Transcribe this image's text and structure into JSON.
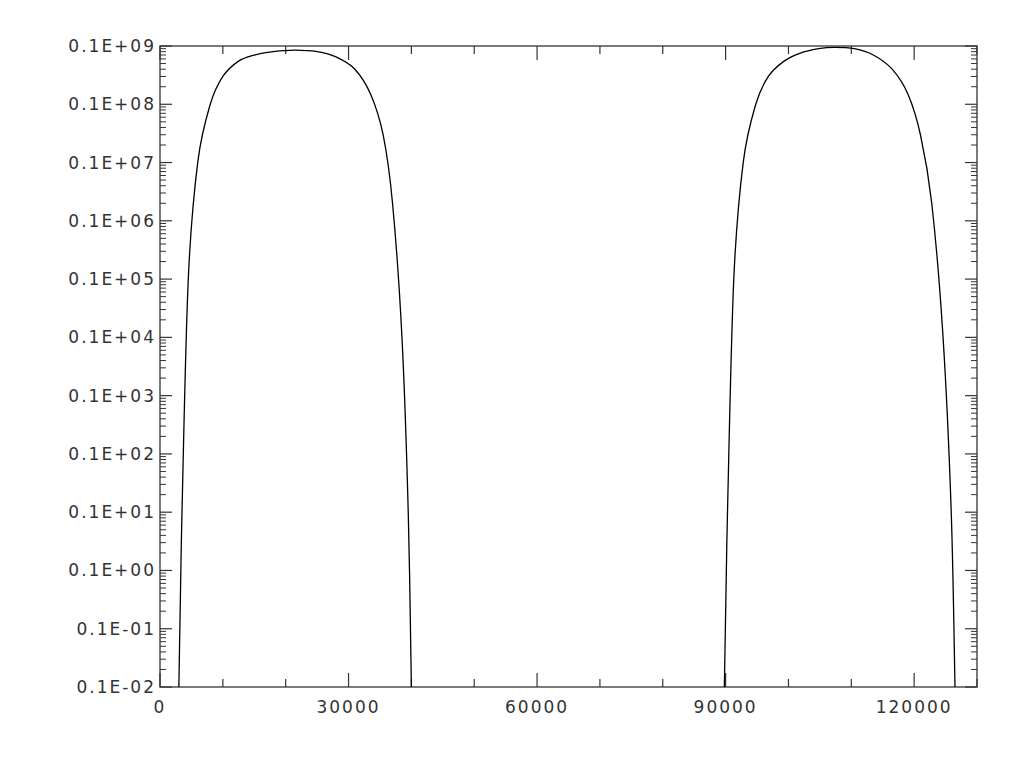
{
  "chart_data": {
    "type": "line",
    "title": "",
    "xlabel": "",
    "ylabel": "",
    "xscale": "linear",
    "yscale": "log",
    "xlim": [
      0,
      130000
    ],
    "ylim": [
      0.001,
      100000000
    ],
    "grid": false,
    "legend": null,
    "x_ticks": [
      0,
      30000,
      60000,
      90000,
      120000
    ],
    "x_tick_labels": [
      "0",
      "30000",
      "60000",
      "90000",
      "120000"
    ],
    "x_minor_step": 10000,
    "y_tick_labels": [
      "0.1E-02",
      "0.1E-01",
      "0.1E+00",
      "0.1E+01",
      "0.1E+02",
      "0.1E+03",
      "0.1E+04",
      "0.1E+05",
      "0.1E+06",
      "0.1E+07",
      "0.1E+08",
      "0.1E+09"
    ],
    "y_tick_exponents": [
      -3,
      -2,
      -1,
      0,
      1,
      2,
      3,
      4,
      5,
      6,
      7,
      8
    ],
    "series": [
      {
        "name": "pulse 1",
        "color": "#000000",
        "x": [
          3000,
          3500,
          4500,
          6000,
          8000,
          10000,
          12500,
          15000,
          18000,
          21500,
          25000,
          28000,
          31000,
          33500,
          35500,
          37000,
          38500,
          39500,
          40000
        ],
        "y": [
          0.001,
          1,
          10000,
          1000000,
          10000000,
          30000000,
          55000000,
          70000000,
          80000000,
          85000000,
          80000000,
          65000000,
          40000000,
          15000000,
          3000000,
          200000,
          1000,
          1,
          0.001
        ]
      },
      {
        "name": "pulse 2",
        "color": "#000000",
        "x": [
          89800,
          90300,
          91300,
          92800,
          94800,
          96800,
          99300,
          101800,
          104800,
          107300,
          110500,
          113500,
          116500,
          119000,
          121000,
          122800,
          124600,
          125900,
          126500
        ],
        "y": [
          0.001,
          1,
          10000,
          1000000,
          10000000,
          30000000,
          55000000,
          75000000,
          90000000,
          95000000,
          90000000,
          70000000,
          40000000,
          15000000,
          3000000,
          200000,
          1000,
          1,
          0.001
        ]
      }
    ]
  }
}
